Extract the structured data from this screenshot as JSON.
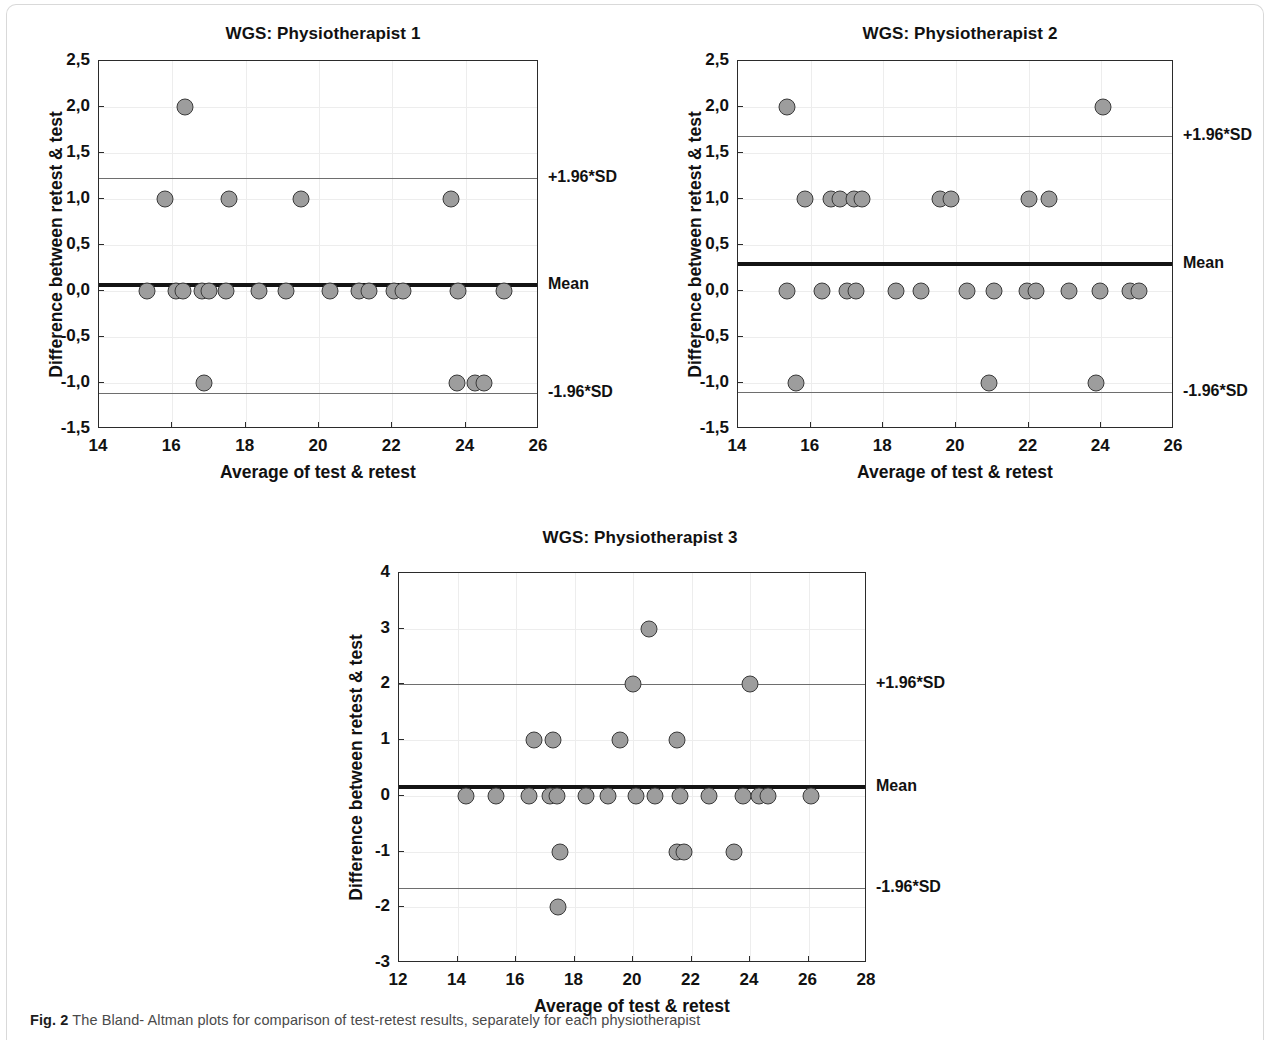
{
  "figure": {
    "caption_label": "Fig. 2",
    "caption_text": "The Bland- Altman plots for comparison of test-retest results, separately for each physiotherapist"
  },
  "chart_data": [
    {
      "type": "scatter",
      "panel_id": "physiotherapist-1",
      "title": "WGS: Physiotherapist 1",
      "xlabel": "Average of test & retest",
      "ylabel": "Difference between retest & test",
      "xlim": [
        14,
        26
      ],
      "ylim": [
        -1.5,
        2.5
      ],
      "xticks": [
        "14",
        "16",
        "18",
        "20",
        "22",
        "24",
        "26"
      ],
      "xtick_values": [
        14,
        16,
        18,
        20,
        22,
        24,
        26
      ],
      "yticks": [
        "-1,5",
        "-1,0",
        "-0,5",
        "0,0",
        "0,5",
        "1,0",
        "1,5",
        "2,0",
        "2,5"
      ],
      "ytick_values": [
        -1.5,
        -1.0,
        -0.5,
        0.0,
        0.5,
        1.0,
        1.5,
        2.0,
        2.5
      ],
      "grid": true,
      "mean": 0.06,
      "upper_loa": 1.23,
      "lower_loa": -1.11,
      "mean_label": "Mean",
      "upper_loa_label": "+1.96*SD",
      "lower_loa_label": "-1.96*SD",
      "points": [
        {
          "x": 16.35,
          "y": 2.0
        },
        {
          "x": 15.8,
          "y": 1.0
        },
        {
          "x": 17.55,
          "y": 1.0
        },
        {
          "x": 19.5,
          "y": 1.0
        },
        {
          "x": 23.6,
          "y": 1.0
        },
        {
          "x": 15.3,
          "y": 0.0
        },
        {
          "x": 16.1,
          "y": 0.0
        },
        {
          "x": 16.3,
          "y": 0.0
        },
        {
          "x": 16.8,
          "y": 0.0
        },
        {
          "x": 17.0,
          "y": 0.0
        },
        {
          "x": 17.45,
          "y": 0.0
        },
        {
          "x": 18.35,
          "y": 0.0
        },
        {
          "x": 19.1,
          "y": 0.0
        },
        {
          "x": 20.3,
          "y": 0.0
        },
        {
          "x": 21.1,
          "y": 0.0
        },
        {
          "x": 21.35,
          "y": 0.0
        },
        {
          "x": 22.05,
          "y": 0.0
        },
        {
          "x": 22.3,
          "y": 0.0
        },
        {
          "x": 23.8,
          "y": 0.0
        },
        {
          "x": 25.05,
          "y": 0.0
        },
        {
          "x": 16.85,
          "y": -1.0
        },
        {
          "x": 23.75,
          "y": -1.0
        },
        {
          "x": 24.25,
          "y": -1.0
        },
        {
          "x": 24.5,
          "y": -1.0
        }
      ]
    },
    {
      "type": "scatter",
      "panel_id": "physiotherapist-2",
      "title": "WGS: Physiotherapist 2",
      "xlabel": "Average of test & retest",
      "ylabel": "Difference between retest & test",
      "xlim": [
        14,
        26
      ],
      "ylim": [
        -1.5,
        2.5
      ],
      "xticks": [
        "14",
        "16",
        "18",
        "20",
        "22",
        "24",
        "26"
      ],
      "xtick_values": [
        14,
        16,
        18,
        20,
        22,
        24,
        26
      ],
      "yticks": [
        "-1,5",
        "-1,0",
        "-0,5",
        "0,0",
        "0,5",
        "1,0",
        "1,5",
        "2,0",
        "2,5"
      ],
      "ytick_values": [
        -1.5,
        -1.0,
        -0.5,
        0.0,
        0.5,
        1.0,
        1.5,
        2.0,
        2.5
      ],
      "grid": true,
      "mean": 0.29,
      "upper_loa": 1.69,
      "lower_loa": -1.1,
      "mean_label": "Mean",
      "upper_loa_label": "+1.96*SD",
      "lower_loa_label": "-1.96*SD",
      "points": [
        {
          "x": 15.35,
          "y": 2.0
        },
        {
          "x": 24.05,
          "y": 2.0
        },
        {
          "x": 15.85,
          "y": 1.0
        },
        {
          "x": 16.55,
          "y": 1.0
        },
        {
          "x": 16.8,
          "y": 1.0
        },
        {
          "x": 17.2,
          "y": 1.0
        },
        {
          "x": 17.4,
          "y": 1.0
        },
        {
          "x": 19.55,
          "y": 1.0
        },
        {
          "x": 19.85,
          "y": 1.0
        },
        {
          "x": 22.0,
          "y": 1.0
        },
        {
          "x": 22.55,
          "y": 1.0
        },
        {
          "x": 15.35,
          "y": 0.0
        },
        {
          "x": 16.3,
          "y": 0.0
        },
        {
          "x": 17.0,
          "y": 0.0
        },
        {
          "x": 17.25,
          "y": 0.0
        },
        {
          "x": 18.35,
          "y": 0.0
        },
        {
          "x": 19.05,
          "y": 0.0
        },
        {
          "x": 20.3,
          "y": 0.0
        },
        {
          "x": 21.05,
          "y": 0.0
        },
        {
          "x": 21.95,
          "y": 0.0
        },
        {
          "x": 22.2,
          "y": 0.0
        },
        {
          "x": 23.1,
          "y": 0.0
        },
        {
          "x": 23.95,
          "y": 0.0
        },
        {
          "x": 24.8,
          "y": 0.0
        },
        {
          "x": 25.05,
          "y": 0.0
        },
        {
          "x": 15.6,
          "y": -1.0
        },
        {
          "x": 20.9,
          "y": -1.0
        },
        {
          "x": 23.85,
          "y": -1.0
        }
      ]
    },
    {
      "type": "scatter",
      "panel_id": "physiotherapist-3",
      "title": "WGS: Physiotherapist 3",
      "xlabel": "Average of test & retest",
      "ylabel": "Difference between retest & test",
      "xlim": [
        12,
        28
      ],
      "ylim": [
        -3,
        4
      ],
      "xticks": [
        "12",
        "14",
        "16",
        "18",
        "20",
        "22",
        "24",
        "26",
        "28"
      ],
      "xtick_values": [
        12,
        14,
        16,
        18,
        20,
        22,
        24,
        26,
        28
      ],
      "yticks": [
        "-3",
        "-2",
        "-1",
        "0",
        "1",
        "2",
        "3",
        "4"
      ],
      "ytick_values": [
        -3,
        -2,
        -1,
        0,
        1,
        2,
        3,
        4
      ],
      "grid": true,
      "mean": 0.16,
      "upper_loa": 2.0,
      "lower_loa": -1.65,
      "mean_label": "Mean",
      "upper_loa_label": "+1.96*SD",
      "lower_loa_label": "-1.96*SD",
      "points": [
        {
          "x": 20.55,
          "y": 3.0
        },
        {
          "x": 20.0,
          "y": 2.0
        },
        {
          "x": 24.0,
          "y": 2.0
        },
        {
          "x": 16.6,
          "y": 1.0
        },
        {
          "x": 17.25,
          "y": 1.0
        },
        {
          "x": 19.55,
          "y": 1.0
        },
        {
          "x": 21.5,
          "y": 1.0
        },
        {
          "x": 14.3,
          "y": 0.0
        },
        {
          "x": 15.3,
          "y": 0.0
        },
        {
          "x": 16.45,
          "y": 0.0
        },
        {
          "x": 17.15,
          "y": 0.0
        },
        {
          "x": 17.4,
          "y": 0.0
        },
        {
          "x": 18.4,
          "y": 0.0
        },
        {
          "x": 19.15,
          "y": 0.0
        },
        {
          "x": 20.1,
          "y": 0.0
        },
        {
          "x": 20.75,
          "y": 0.0
        },
        {
          "x": 21.6,
          "y": 0.0
        },
        {
          "x": 22.6,
          "y": 0.0
        },
        {
          "x": 23.75,
          "y": 0.0
        },
        {
          "x": 24.3,
          "y": 0.0
        },
        {
          "x": 24.6,
          "y": 0.0
        },
        {
          "x": 26.1,
          "y": 0.0
        },
        {
          "x": 17.5,
          "y": -1.0
        },
        {
          "x": 21.5,
          "y": -1.0
        },
        {
          "x": 21.75,
          "y": -1.0
        },
        {
          "x": 23.45,
          "y": -1.0
        },
        {
          "x": 17.45,
          "y": -2.0
        }
      ]
    }
  ]
}
